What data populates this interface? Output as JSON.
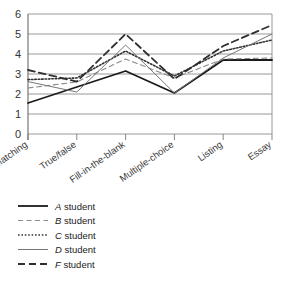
{
  "chart_data": {
    "type": "line",
    "title": "",
    "subtitle": "",
    "xlabel": "",
    "ylabel": "",
    "categories": [
      "Matching",
      "True/false",
      "Fill-in-the-blank",
      "Multiple-choice",
      "Listing",
      "Essay"
    ],
    "ylim": [
      0,
      6
    ],
    "yticks": [
      0,
      1,
      2,
      3,
      4,
      5,
      6
    ],
    "ytick_labels": [
      "0",
      "1",
      "2",
      "3",
      "4",
      "5",
      "6"
    ],
    "grid": true,
    "grid_axis": "y",
    "legend_position": "below-left",
    "series": [
      {
        "name": "A student",
        "key": "A",
        "suffix": " student",
        "style": "solid",
        "width": 1.8,
        "color": "#1a1a1a",
        "values": [
          1.55,
          2.35,
          3.15,
          2.05,
          3.7,
          3.7
        ]
      },
      {
        "name": "B student",
        "key": "B",
        "suffix": " student",
        "style": "dashed",
        "width": 1.1,
        "color": "#8a8a8a",
        "values": [
          2.3,
          2.6,
          3.75,
          2.8,
          3.75,
          3.8
        ]
      },
      {
        "name": "C student",
        "key": "C",
        "suffix": " student",
        "style": "dotted",
        "width": 1.6,
        "color": "#333333",
        "values": [
          2.72,
          2.8,
          4.15,
          2.9,
          4.15,
          4.7
        ]
      },
      {
        "name": "D student",
        "key": "D",
        "suffix": " student",
        "style": "solid",
        "width": 1.0,
        "color": "#777777",
        "values": [
          2.62,
          2.1,
          4.45,
          2.05,
          3.8,
          5.0
        ]
      },
      {
        "name": "F student",
        "key": "F",
        "suffix": " student",
        "style": "dashed",
        "width": 1.8,
        "color": "#2f2f2f",
        "values": [
          3.2,
          2.62,
          5.0,
          2.75,
          4.4,
          5.45
        ]
      }
    ]
  }
}
